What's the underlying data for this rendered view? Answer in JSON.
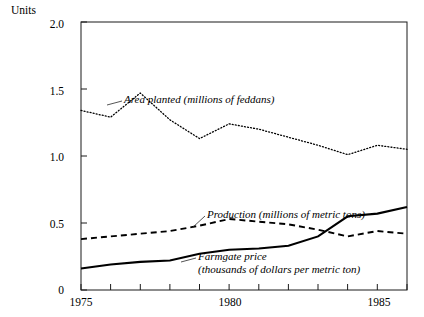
{
  "chart_data": {
    "type": "line",
    "title": "",
    "subtitle": "",
    "ylabel": "Units",
    "xlabel": "",
    "ylim": [
      0,
      2.0
    ],
    "xlim": [
      1975,
      1986
    ],
    "grid": false,
    "legend_position": "inline-annotations",
    "yticks": [
      "0",
      "0.5",
      "1.0",
      "1.5",
      "2.0"
    ],
    "ytick_values": [
      0,
      0.5,
      1.0,
      1.5,
      2.0
    ],
    "xticks": [
      "1975",
      "1980",
      "1985"
    ],
    "xtick_values": [
      1975,
      1980,
      1985
    ],
    "x": [
      1975,
      1976,
      1977,
      1978,
      1979,
      1980,
      1981,
      1982,
      1983,
      1984,
      1985,
      1986
    ],
    "series": [
      {
        "name": "Area planted (millions of feddans)",
        "style": "dotted",
        "label_line1": "Area planted (millions of feddans)",
        "label_line2": "",
        "values": [
          1.34,
          1.29,
          1.47,
          1.27,
          1.13,
          1.24,
          1.2,
          1.14,
          1.08,
          1.01,
          1.08,
          1.05
        ]
      },
      {
        "name": "Production (millions of metric tons)",
        "style": "dashed",
        "label_line1": "Production (millions of metric tons)",
        "label_line2": "",
        "values": [
          0.38,
          0.4,
          0.42,
          0.44,
          0.48,
          0.53,
          0.51,
          0.49,
          0.45,
          0.4,
          0.44,
          0.42
        ]
      },
      {
        "name": "Farmgate price (thousands of dollars per metric ton)",
        "style": "solid",
        "label_line1": "Farmgate price",
        "label_line2": "(thousands of dollars per metric ton)",
        "values": [
          0.16,
          0.19,
          0.21,
          0.22,
          0.27,
          0.3,
          0.31,
          0.33,
          0.4,
          0.55,
          0.57,
          0.62
        ]
      }
    ]
  },
  "annotations": {
    "area_planted": "Area planted (millions of feddans)",
    "production": "Production (millions of metric tons)",
    "farmgate_price_line1": "Farmgate price",
    "farmgate_price_line2": "(thousands of dollars per metric ton)"
  },
  "axes": {
    "units_label": "Units",
    "y_labels": [
      "2.0",
      "1.5",
      "1.0",
      "0.5",
      "0"
    ],
    "x_labels": [
      "1975",
      "1980",
      "1985"
    ]
  },
  "colors": {
    "axis": "#1a1a1a",
    "series_line": "#000000",
    "background": "#ffffff"
  }
}
